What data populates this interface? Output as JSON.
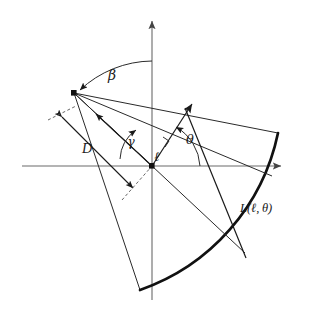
{
  "figure": {
    "background_color": "#ffffff",
    "stroke_color": "#1a1a1a",
    "thick_arc_color": "#111111",
    "axis_color": "#666666",
    "width": 317,
    "height": 324
  },
  "labels": {
    "beta": "β",
    "gamma": "γ",
    "theta": "θ",
    "ell": "ℓ",
    "D": "D",
    "line_L": "L(ℓ, θ)"
  },
  "geometry": {
    "origin": {
      "x": 152,
      "y": 166
    },
    "apex": {
      "x": 74,
      "y": 93
    },
    "y_axis": {
      "x": 152,
      "y_top": 17,
      "y_bottom": 300
    },
    "x_axis": {
      "y": 166,
      "x_left": 22,
      "x_right": 285
    },
    "arc_outer": {
      "start": {
        "x": 278,
        "y": 133
      },
      "mid": {
        "x": 232,
        "y": 240
      },
      "end": {
        "x": 140,
        "y": 290
      },
      "radius": 212
    },
    "theta_arrow_tip": {
      "x": 190,
      "y": 108
    },
    "normal_foot": {
      "x": 152,
      "y": 166
    },
    "right_angle_marker": {
      "x": 148,
      "y": 131
    }
  },
  "label_positions": {
    "beta": {
      "x": 112,
      "y": 80
    },
    "gamma": {
      "x": 131,
      "y": 145
    },
    "theta": {
      "x": 190,
      "y": 144
    },
    "ell": {
      "x": 157,
      "y": 160
    },
    "D": {
      "x": 87,
      "y": 152
    },
    "line_L": {
      "x": 240,
      "y": 212
    }
  }
}
